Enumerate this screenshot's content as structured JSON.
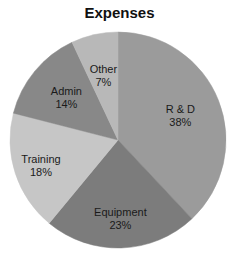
{
  "chart_data": {
    "type": "pie",
    "title": "Expenses",
    "categories": [
      "R & D",
      "Equipment",
      "Training",
      "Admin",
      "Other"
    ],
    "values": [
      38,
      23,
      18,
      14,
      7
    ],
    "value_labels": [
      "38%",
      "23%",
      "18%",
      "14%",
      "7%"
    ],
    "colors": [
      "#9b9b9b",
      "#7c7c7c",
      "#c6c6c6",
      "#888888",
      "#b8b8b8"
    ],
    "start_angle": "12 o'clock",
    "direction": "clockwise",
    "legend": "none (labels on slices)"
  }
}
